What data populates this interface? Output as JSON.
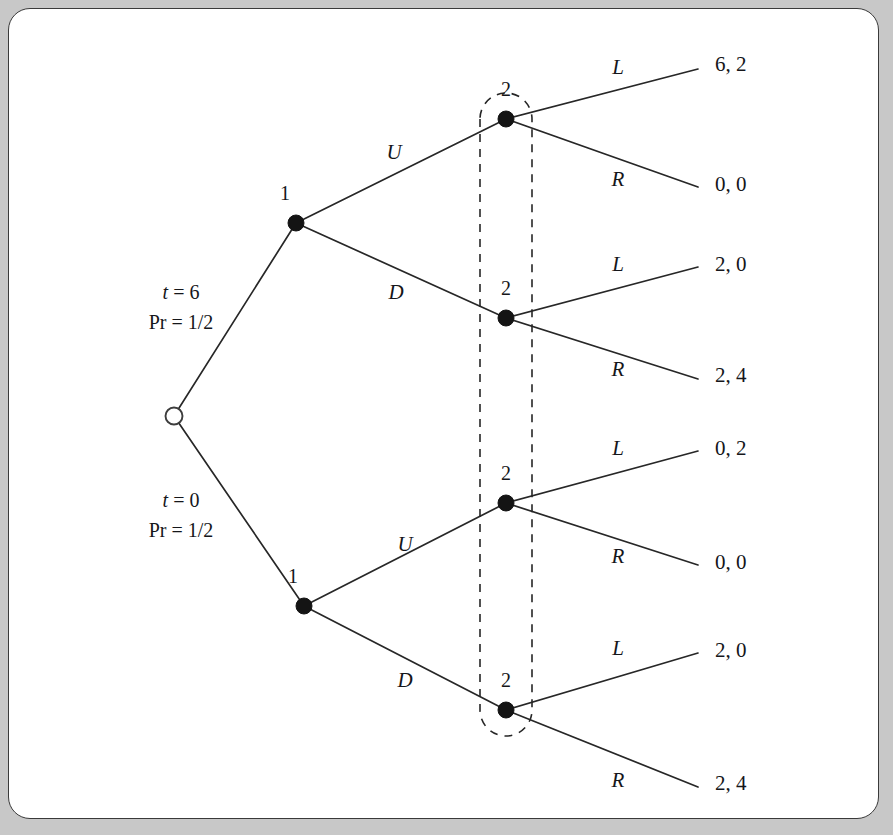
{
  "figure": {
    "panel_background": "#ffffff",
    "outer_background": "#c8c8c8",
    "line_color": "#272727"
  },
  "chart_data": {
    "type": "diagram",
    "diagram_kind": "game-tree",
    "title": "",
    "root": {
      "id": "chance",
      "player": "chance",
      "marker": "hollow-circle",
      "x": 165,
      "y": 407
    },
    "chance_branches": [
      {
        "id": "chance-up",
        "type_label": "t = 6",
        "prob_label": "Pr = 1/2",
        "type_value": 6,
        "probability": "1/2",
        "annotation_x": 172,
        "annotation_y": 290
      },
      {
        "id": "chance-down",
        "type_label": "t = 0",
        "prob_label": "Pr = 1/2",
        "type_value": 0,
        "probability": "1/2",
        "annotation_x": 172,
        "annotation_y": 498
      }
    ],
    "player1_nodes": [
      {
        "id": "p1-top",
        "label": "1",
        "x": 287,
        "y": 214,
        "label_x": 276,
        "label_y": 191
      },
      {
        "id": "p1-bottom",
        "label": "1",
        "x": 295,
        "y": 597,
        "label_x": 284,
        "label_y": 574
      }
    ],
    "player1_actions": [
      {
        "id": "act-U-top",
        "label": "U",
        "x": 385,
        "y": 150,
        "from": "p1-top",
        "to": "p2-a"
      },
      {
        "id": "act-D-top",
        "label": "D",
        "x": 387,
        "y": 290,
        "from": "p1-top",
        "to": "p2-b"
      },
      {
        "id": "act-U-bottom",
        "label": "U",
        "x": 396,
        "y": 542,
        "from": "p1-bottom",
        "to": "p2-c"
      },
      {
        "id": "act-D-bottom",
        "label": "D",
        "x": 396,
        "y": 678,
        "from": "p1-bottom",
        "to": "p2-d"
      }
    ],
    "player2_nodes": [
      {
        "id": "p2-a",
        "label": "2",
        "x": 497,
        "y": 110,
        "label_x": 497,
        "label_y": 87
      },
      {
        "id": "p2-b",
        "label": "2",
        "x": 497,
        "y": 309,
        "label_x": 497,
        "label_y": 286
      },
      {
        "id": "p2-c",
        "label": "2",
        "x": 497,
        "y": 494,
        "label_x": 497,
        "label_y": 471
      },
      {
        "id": "p2-d",
        "label": "2",
        "x": 497,
        "y": 701,
        "label_x": 497,
        "label_y": 678
      }
    ],
    "information_set": {
      "id": "player2-information-set",
      "player": "2",
      "members": [
        "p2-a",
        "p2-b",
        "p2-c",
        "p2-d"
      ],
      "style": "dashed-oval",
      "x": 470,
      "y": 52,
      "width": 53,
      "height": 707,
      "cap_radius": 26
    },
    "terminal_nodes": [
      {
        "id": "t1",
        "from": "p2-a",
        "action": "L",
        "action_x": 609,
        "action_y": 65,
        "payoff": "6, 2",
        "payoff_x": 706,
        "payoff_y": 62,
        "line_end_x": 689,
        "line_end_y": 60,
        "player1_payoff": 6,
        "player2_payoff": 2
      },
      {
        "id": "t2",
        "from": "p2-a",
        "action": "R",
        "action_x": 609,
        "action_y": 177,
        "payoff": "0, 0",
        "payoff_x": 706,
        "payoff_y": 182,
        "line_end_x": 689,
        "line_end_y": 178,
        "player1_payoff": 0,
        "player2_payoff": 0
      },
      {
        "id": "t3",
        "from": "p2-b",
        "action": "L",
        "action_x": 609,
        "action_y": 262,
        "payoff": "2, 0",
        "payoff_x": 706,
        "payoff_y": 262,
        "line_end_x": 689,
        "line_end_y": 258,
        "player1_payoff": 2,
        "player2_payoff": 0
      },
      {
        "id": "t4",
        "from": "p2-b",
        "action": "R",
        "action_x": 609,
        "action_y": 367,
        "payoff": "2, 4",
        "payoff_x": 706,
        "payoff_y": 373,
        "line_end_x": 689,
        "line_end_y": 370,
        "player1_payoff": 2,
        "player2_payoff": 4
      },
      {
        "id": "t5",
        "from": "p2-c",
        "action": "L",
        "action_x": 609,
        "action_y": 446,
        "payoff": "0, 2",
        "payoff_x": 706,
        "payoff_y": 446,
        "line_end_x": 689,
        "line_end_y": 442,
        "player1_payoff": 0,
        "player2_payoff": 2
      },
      {
        "id": "t6",
        "from": "p2-c",
        "action": "R",
        "action_x": 609,
        "action_y": 554,
        "payoff": "0, 0",
        "payoff_x": 706,
        "payoff_y": 560,
        "line_end_x": 689,
        "line_end_y": 556,
        "player1_payoff": 0,
        "player2_payoff": 0
      },
      {
        "id": "t7",
        "from": "p2-d",
        "action": "L",
        "action_x": 609,
        "action_y": 646,
        "payoff": "2, 0",
        "payoff_x": 706,
        "payoff_y": 648,
        "line_end_x": 689,
        "line_end_y": 644,
        "player1_payoff": 2,
        "player2_payoff": 0
      },
      {
        "id": "t8",
        "from": "p2-d",
        "action": "R",
        "action_x": 609,
        "action_y": 778,
        "payoff": "2, 4",
        "payoff_x": 706,
        "payoff_y": 781,
        "line_end_x": 689,
        "line_end_y": 778,
        "player1_payoff": 2,
        "player2_payoff": 4
      }
    ]
  }
}
